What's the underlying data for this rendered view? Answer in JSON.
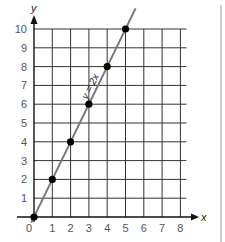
{
  "chart_data": {
    "type": "line",
    "title": "",
    "xlabel": "x",
    "ylabel": "y",
    "xlim": [
      0,
      8
    ],
    "ylim": [
      0,
      10
    ],
    "x_ticks": [
      "0",
      "1",
      "2",
      "3",
      "4",
      "5",
      "6",
      "7",
      "8"
    ],
    "y_ticks": [
      "1",
      "2",
      "3",
      "4",
      "5",
      "6",
      "7",
      "8",
      "9",
      "10"
    ],
    "grid": true,
    "series": [
      {
        "name": "y = 2x",
        "x": [
          0,
          1,
          2,
          3,
          4,
          5
        ],
        "y": [
          0,
          2,
          4,
          6,
          8,
          10
        ],
        "line_color": "#777777",
        "marker_color": "#000000"
      }
    ],
    "annotations": [
      {
        "text": "y = 2x",
        "position": "along line near (2.5, 7)",
        "rotation": -63
      }
    ]
  }
}
